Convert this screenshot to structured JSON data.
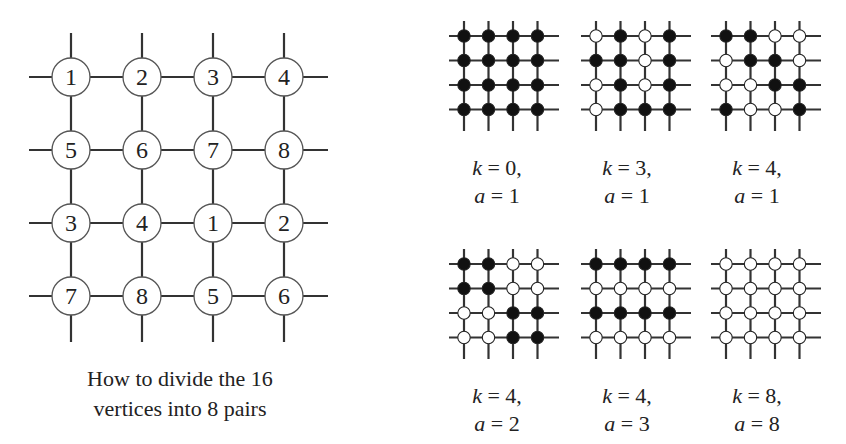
{
  "main_grid": {
    "labels": [
      [
        "1",
        "2",
        "3",
        "4"
      ],
      [
        "5",
        "6",
        "7",
        "8"
      ],
      [
        "3",
        "4",
        "1",
        "2"
      ],
      [
        "7",
        "8",
        "5",
        "6"
      ]
    ],
    "caption_line1": "How to divide the 16",
    "caption_line2": "vertices into 8 pairs"
  },
  "small_grids": [
    {
      "k": "0",
      "a": "1",
      "k_text": "k = 0,",
      "a_text": "a = 1",
      "pattern": [
        [
          "B",
          "B",
          "B",
          "B"
        ],
        [
          "B",
          "B",
          "B",
          "B"
        ],
        [
          "B",
          "B",
          "B",
          "B"
        ],
        [
          "B",
          "B",
          "B",
          "B"
        ]
      ]
    },
    {
      "k": "3",
      "a": "1",
      "k_text": "k = 3,",
      "a_text": "a = 1",
      "pattern": [
        [
          "W",
          "B",
          "W",
          "B"
        ],
        [
          "B",
          "B",
          "W",
          "B"
        ],
        [
          "W",
          "B",
          "W",
          "B"
        ],
        [
          "W",
          "B",
          "B",
          "B"
        ]
      ]
    },
    {
      "k": "4",
      "a": "1",
      "k_text": "k = 4,",
      "a_text": "a = 1",
      "pattern": [
        [
          "B",
          "B",
          "W",
          "W"
        ],
        [
          "W",
          "B",
          "B",
          "W"
        ],
        [
          "W",
          "W",
          "B",
          "B"
        ],
        [
          "B",
          "W",
          "W",
          "B"
        ]
      ]
    },
    {
      "k": "4",
      "a": "2",
      "k_text": "k = 4,",
      "a_text": "a = 2",
      "pattern": [
        [
          "B",
          "B",
          "W",
          "W"
        ],
        [
          "B",
          "B",
          "W",
          "W"
        ],
        [
          "W",
          "W",
          "B",
          "B"
        ],
        [
          "W",
          "W",
          "B",
          "B"
        ]
      ]
    },
    {
      "k": "4",
      "a": "3",
      "k_text": "k = 4,",
      "a_text": "a = 3",
      "pattern": [
        [
          "B",
          "B",
          "B",
          "B"
        ],
        [
          "W",
          "W",
          "W",
          "W"
        ],
        [
          "B",
          "B",
          "B",
          "B"
        ],
        [
          "W",
          "W",
          "W",
          "W"
        ]
      ]
    },
    {
      "k": "8",
      "a": "8",
      "k_text": "k = 8,",
      "a_text": "a = 8",
      "pattern": [
        [
          "W",
          "W",
          "W",
          "W"
        ],
        [
          "W",
          "W",
          "W",
          "W"
        ],
        [
          "W",
          "W",
          "W",
          "W"
        ],
        [
          "W",
          "W",
          "W",
          "W"
        ]
      ]
    }
  ],
  "colors": {
    "line": "#333333",
    "black_node": "#111111",
    "white_node": "#ffffff"
  }
}
